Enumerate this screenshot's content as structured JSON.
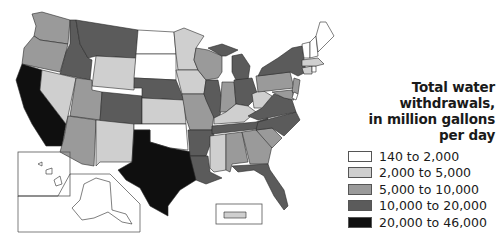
{
  "legend": {
    "title_line1": "Total water withdrawals,",
    "title_line2": "in million gallons per day",
    "items": [
      {
        "label": "140 to 2,000",
        "color": "#ffffff"
      },
      {
        "label": "2,000 to 5,000",
        "color": "#cfcfcf"
      },
      {
        "label": "5,000 to 10,000",
        "color": "#9a9a9a"
      },
      {
        "label": "10,000 to 20,000",
        "color": "#5b5b5b"
      },
      {
        "label": "20,000 to 46,000",
        "color": "#0f0f0f"
      }
    ]
  },
  "states": {
    "WA": "5,000 to 10,000",
    "OR": "5,000 to 10,000",
    "CA": "20,000 to 46,000",
    "ID": "10,000 to 20,000",
    "NV": "2,000 to 5,000",
    "MT": "10,000 to 20,000",
    "WY": "2,000 to 5,000",
    "UT": "5,000 to 10,000",
    "AZ": "5,000 to 10,000",
    "CO": "10,000 to 20,000",
    "NM": "2,000 to 5,000",
    "ND": "140 to 2,000",
    "SD": "140 to 2,000",
    "NE": "10,000 to 20,000",
    "KS": "2,000 to 5,000",
    "OK": "140 to 2,000",
    "TX": "20,000 to 46,000",
    "MN": "2,000 to 5,000",
    "IA": "2,000 to 5,000",
    "MO": "5,000 to 10,000",
    "AR": "10,000 to 20,000",
    "LA": "10,000 to 20,000",
    "WI": "5,000 to 10,000",
    "IL": "10,000 to 20,000",
    "MI": "10,000 to 20,000",
    "IN": "5,000 to 10,000",
    "OH": "10,000 to 20,000",
    "KY": "2,000 to 5,000",
    "TN": "10,000 to 20,000",
    "MS": "2,000 to 5,000",
    "AL": "5,000 to 10,000",
    "GA": "5,000 to 10,000",
    "FL": "10,000 to 20,000",
    "SC": "5,000 to 10,000",
    "NC": "10,000 to 20,000",
    "VA": "10,000 to 20,000",
    "WV": "2,000 to 5,000",
    "PA": "5,000 to 10,000",
    "NY": "10,000 to 20,000",
    "NJ": "5,000 to 10,000",
    "MD": "5,000 to 10,000",
    "DE": "140 to 2,000",
    "CT": "2,000 to 5,000",
    "RI": "140 to 2,000",
    "MA": "2,000 to 5,000",
    "VT": "140 to 2,000",
    "NH": "140 to 2,000",
    "ME": "140 to 2,000",
    "AK": "140 to 2,000",
    "HI": "140 to 2,000",
    "PR": "2,000 to 5,000"
  }
}
